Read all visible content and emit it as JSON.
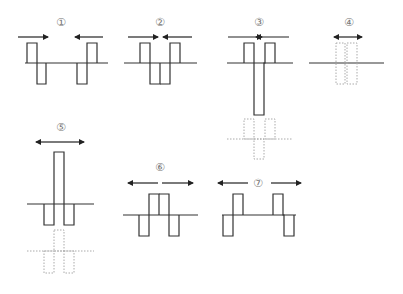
{
  "diagram": {
    "colors": {
      "solid": "#333333",
      "ghost": "#aaaaaa",
      "label": "#777777",
      "arrow": "#222222"
    },
    "panels": [
      {
        "id": 1,
        "label": "①",
        "arrows": "inward, separated"
      },
      {
        "id": 2,
        "label": "②",
        "arrows": "inward, meeting"
      },
      {
        "id": 3,
        "label": "③",
        "arrows": "inward, overlapping at center"
      },
      {
        "id": 4,
        "label": "④",
        "arrows": "double-headed short"
      },
      {
        "id": 5,
        "label": "⑤",
        "arrows": "double-headed"
      },
      {
        "id": 6,
        "label": "⑥",
        "arrows": "outward, close"
      },
      {
        "id": 7,
        "label": "⑦",
        "arrows": "outward, far"
      }
    ]
  }
}
